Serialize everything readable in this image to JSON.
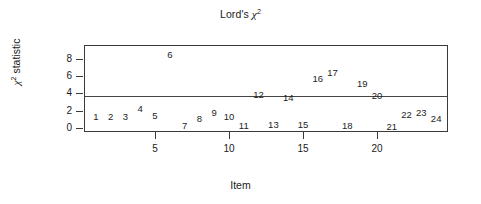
{
  "chart_data": {
    "type": "scatter",
    "title_parts": {
      "prefix": "Lord's ",
      "symbol": "χ",
      "exponent": "2"
    },
    "xlabel": "Item",
    "ylabel": "χ² statistic",
    "ylabel_parts": {
      "symbol": "χ",
      "exponent": "2",
      "suffix": " statistic"
    },
    "grid": false,
    "legend": null,
    "xlim": [
      0.2,
      24.8
    ],
    "ylim": [
      -0.45,
      9.6
    ],
    "xticks": [
      5,
      10,
      15,
      20
    ],
    "xtick_labels": [
      "5",
      "10",
      "15",
      "20"
    ],
    "yticks": [
      0,
      2,
      4,
      6,
      8
    ],
    "ytick_labels": [
      "0",
      "2",
      "4",
      "6",
      "8"
    ],
    "marker_style": "text-label",
    "annotations": [
      {
        "label": "reference-line",
        "type": "hline",
        "y": 3.7
      }
    ],
    "x": [
      1,
      2,
      3,
      4,
      5,
      6,
      7,
      8,
      9,
      10,
      11,
      12,
      13,
      14,
      15,
      16,
      17,
      18,
      19,
      20,
      21,
      22,
      23,
      24
    ],
    "y": [
      1.3,
      1.3,
      1.3,
      2.2,
      1.4,
      8.5,
      0.3,
      1.1,
      1.7,
      1.3,
      0.2,
      3.8,
      0.4,
      3.5,
      0.4,
      5.7,
      6.4,
      0.3,
      5.1,
      3.7,
      0.1,
      1.5,
      1.7,
      1.1
    ],
    "point_labels": [
      "1",
      "2",
      "3",
      "4",
      "5",
      "6",
      "7",
      "8",
      "9",
      "10",
      "11",
      "12",
      "13",
      "14",
      "15",
      "16",
      "17",
      "18",
      "19",
      "20",
      "21",
      "22",
      "23",
      "24"
    ]
  }
}
